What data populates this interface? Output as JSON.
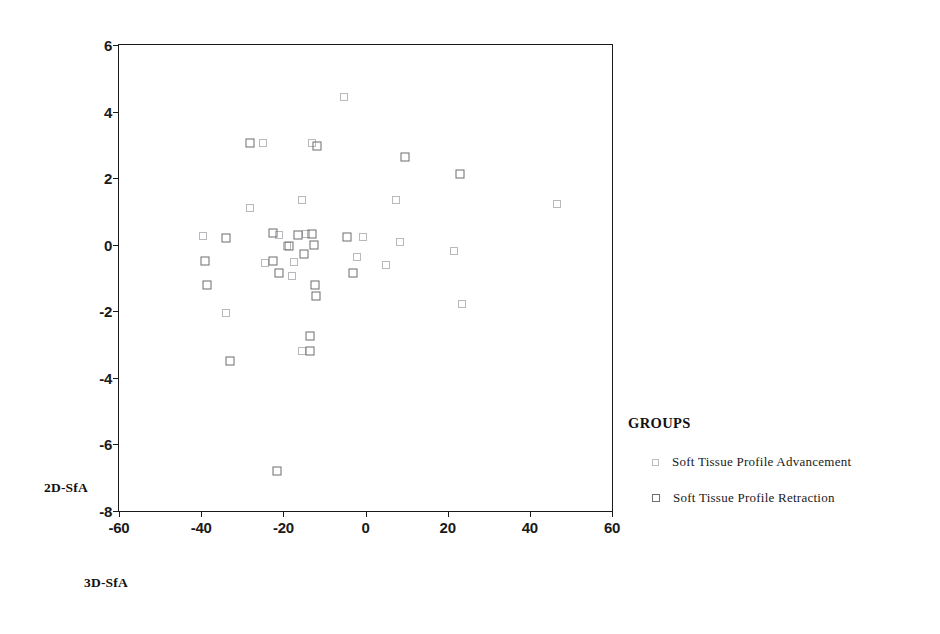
{
  "chart_data": {
    "type": "scatter",
    "title": "",
    "xlabel": "3D-SfA",
    "ylabel": "2D-SfA",
    "xlim": [
      -60,
      60
    ],
    "ylim": [
      -8,
      6
    ],
    "xticks": [
      "-60",
      "-40",
      "-20",
      "0",
      "20",
      "40",
      "60"
    ],
    "xtick_values": [
      -60,
      -40,
      -20,
      0,
      20,
      40,
      60
    ],
    "yticks": [
      "6",
      "4",
      "2",
      "0",
      "-2",
      "-4",
      "-6",
      "-8"
    ],
    "ytick_values": [
      6,
      4,
      2,
      0,
      -2,
      -4,
      -6,
      -8
    ],
    "grid": false,
    "legend_position": "right",
    "legend_title": "GROUPS",
    "marker_colors": {
      "advancement": "#bcbcc0",
      "retraction": "#6d6d72",
      "axis": "#1a1a1a",
      "background": "#ffffff"
    },
    "series": [
      {
        "name": "Soft Tissue Profile Advancement",
        "marker": "open-square-light",
        "color": "#bcbcc0",
        "points": [
          [
            -5.2,
            4.45
          ],
          [
            -25.0,
            3.05
          ],
          [
            -13.0,
            3.05
          ],
          [
            -28.0,
            1.1
          ],
          [
            -15.5,
            1.35
          ],
          [
            7.5,
            1.35
          ],
          [
            46.5,
            1.22
          ],
          [
            -39.5,
            0.25
          ],
          [
            -21.0,
            0.3
          ],
          [
            -14.5,
            0.32
          ],
          [
            -0.6,
            0.22
          ],
          [
            8.5,
            0.08
          ],
          [
            -19.0,
            -0.05
          ],
          [
            -24.5,
            -0.55
          ],
          [
            -17.5,
            -0.52
          ],
          [
            -2.0,
            -0.38
          ],
          [
            5.0,
            -0.62
          ],
          [
            21.5,
            -0.2
          ],
          [
            -18.0,
            -0.95
          ],
          [
            -34.0,
            -2.05
          ],
          [
            -15.5,
            -3.2
          ],
          [
            23.5,
            -1.78
          ]
        ]
      },
      {
        "name": "Soft Tissue Profile Retraction",
        "marker": "open-square-dark",
        "color": "#6d6d72",
        "points": [
          [
            -28.0,
            3.05
          ],
          [
            -11.8,
            2.98
          ],
          [
            9.5,
            2.65
          ],
          [
            23.0,
            2.12
          ],
          [
            -34.0,
            0.2
          ],
          [
            -22.5,
            0.35
          ],
          [
            -16.5,
            0.28
          ],
          [
            -13.0,
            0.32
          ],
          [
            -4.5,
            0.22
          ],
          [
            -18.5,
            -0.05
          ],
          [
            -12.5,
            -0.02
          ],
          [
            -15.0,
            -0.28
          ],
          [
            -39.0,
            -0.48
          ],
          [
            -22.5,
            -0.5
          ],
          [
            -12.2,
            -1.22
          ],
          [
            -12.0,
            -1.55
          ],
          [
            -21.0,
            -0.85
          ],
          [
            -3.0,
            -0.85
          ],
          [
            -38.5,
            -1.22
          ],
          [
            -33.0,
            -3.5
          ],
          [
            -13.5,
            -2.75
          ],
          [
            -13.5,
            -3.2
          ],
          [
            -21.5,
            -6.8
          ]
        ]
      }
    ]
  }
}
